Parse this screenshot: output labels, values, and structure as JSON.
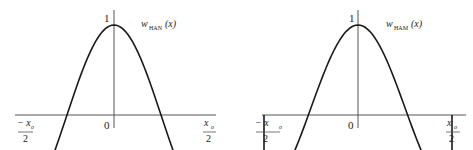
{
  "figures": [
    {
      "name": "hanning",
      "function_label": "w",
      "function_subscript": "HAN",
      "function_arg": "(x)",
      "peak_label": "1",
      "origin_label": "0",
      "left_label_num": "− x",
      "left_label_sub": "o",
      "left_label_den": "2",
      "right_label_num": "x",
      "right_label_sub": "o",
      "right_label_den": "2",
      "end_value": 0
    },
    {
      "name": "hamming",
      "function_label": "w",
      "function_subscript": "HAM",
      "function_arg": "(x)",
      "peak_label": "1",
      "origin_label": "0",
      "left_label_num": "− x",
      "left_label_sub": "o",
      "left_label_den": "2",
      "right_label_num": "x",
      "right_label_sub": "o",
      "right_label_den": "2",
      "end_value": 0.08
    }
  ],
  "colors": {
    "curve": "#1a1a1a",
    "axis": "#555555",
    "text": "#222222"
  }
}
